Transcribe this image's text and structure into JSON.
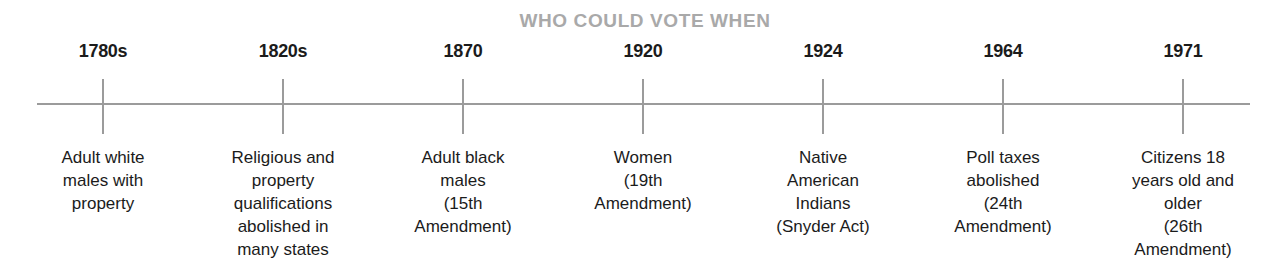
{
  "chart_data": {
    "type": "table",
    "title": "WHO COULD VOTE WHEN",
    "xlabel": "",
    "ylabel": "",
    "grid": false,
    "legend": "none",
    "orientation": "horizontal-timeline",
    "axis": {
      "start_px": 37,
      "end_px": 1250,
      "y_px": 104,
      "color": "#9b9b9b"
    },
    "categories": [
      "1780s",
      "1820s",
      "1870",
      "1920",
      "1924",
      "1964",
      "1971"
    ],
    "values": [
      "Adult white males with property",
      "Religious and property qualifications abolished in many states",
      "Adult black males (15th Amendment)",
      "Women (19th Amendment)",
      "Native American Indians (Snyder Act)",
      "Poll taxes abolished (24th Amendment)",
      "Citizens 18 years old and older (26th Amendment)"
    ],
    "events": [
      {
        "year": "1780s",
        "x_px": 103,
        "description": "Adult white\nmales with\nproperty"
      },
      {
        "year": "1820s",
        "x_px": 283,
        "description": "Religious and\nproperty\nqualifications\nabolished in\nmany states"
      },
      {
        "year": "1870",
        "x_px": 463,
        "description": "Adult black\nmales\n(15th\nAmendment)"
      },
      {
        "year": "1920",
        "x_px": 643,
        "description": "Women\n(19th\nAmendment)"
      },
      {
        "year": "1924",
        "x_px": 823,
        "description": "Native\nAmerican\nIndians\n(Snyder Act)"
      },
      {
        "year": "1964",
        "x_px": 1003,
        "description": "Poll taxes\nabolished\n(24th\nAmendment)"
      },
      {
        "year": "1971",
        "x_px": 1183,
        "description": "Citizens 18\nyears old and\nolder\n(26th\nAmendment)"
      }
    ]
  },
  "colors": {
    "title": "#a9a9a9",
    "axis": "#9b9b9b",
    "text": "#1b1b1b",
    "background": "#ffffff"
  }
}
